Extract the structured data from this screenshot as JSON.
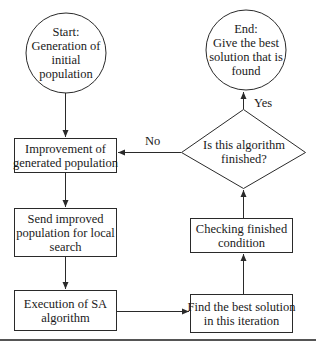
{
  "diagram": {
    "type": "flowchart",
    "colors": {
      "stroke": "#2a2a2a",
      "text": "#1a1a1a",
      "background": "#ffffff",
      "rule": "#555555"
    },
    "nodes": {
      "start": {
        "shape": "circle",
        "lines": [
          "Start:",
          "Generation of",
          "initial",
          "population"
        ]
      },
      "end": {
        "shape": "circle",
        "lines": [
          "End:",
          "Give the best",
          "solution that is",
          "found"
        ]
      },
      "improve": {
        "shape": "rect",
        "lines": [
          "Improvement of",
          "generated population"
        ]
      },
      "decision": {
        "shape": "diamond",
        "lines": [
          "Is this algorithm",
          "finished?"
        ]
      },
      "send": {
        "shape": "rect",
        "lines": [
          "Send improved",
          "population for local",
          "search"
        ]
      },
      "checking": {
        "shape": "rect",
        "lines": [
          "Checking finished",
          "condition"
        ]
      },
      "execution": {
        "shape": "rect",
        "lines": [
          "Execution of SA",
          "algorithm"
        ]
      },
      "findbest": {
        "shape": "rect",
        "lines": [
          "Find the best solution",
          "in this iteration"
        ]
      }
    },
    "edges": [
      {
        "from": "start",
        "to": "improve",
        "label": ""
      },
      {
        "from": "improve",
        "to": "send",
        "label": ""
      },
      {
        "from": "send",
        "to": "execution",
        "label": ""
      },
      {
        "from": "execution",
        "to": "findbest",
        "label": ""
      },
      {
        "from": "findbest",
        "to": "checking",
        "label": ""
      },
      {
        "from": "checking",
        "to": "decision",
        "label": ""
      },
      {
        "from": "decision",
        "to": "end",
        "label": "Yes"
      },
      {
        "from": "decision",
        "to": "improve",
        "label": "No"
      }
    ],
    "edge_labels": {
      "yes": "Yes",
      "no": "No"
    }
  }
}
